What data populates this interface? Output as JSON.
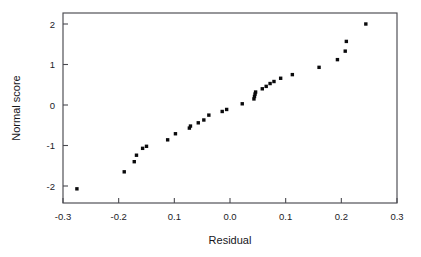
{
  "chart_data": {
    "type": "scatter",
    "title": "",
    "xlabel": "Residual",
    "ylabel": "Normal score",
    "xlim": [
      -0.3,
      0.3
    ],
    "ylim": [
      -2.2,
      2.2
    ],
    "grid": false,
    "legend": null,
    "xticks": [
      -0.3,
      -0.2,
      -0.1,
      0.0,
      0.1,
      0.2,
      0.3
    ],
    "xtick_labels": [
      "-0.3",
      "-0.2",
      "0.1",
      "0.0",
      "0.1",
      "0.2",
      "0.3"
    ],
    "yticks": [
      2,
      1,
      0,
      -1,
      -2
    ],
    "ytick_labels": [
      "2",
      "1",
      "0",
      "-1",
      "-2"
    ],
    "marker": "square",
    "marker_color": "#0a0a0c",
    "marker_size": 3.4,
    "points": [
      {
        "x": -0.275,
        "y": -2.07
      },
      {
        "x": -0.19,
        "y": -1.65
      },
      {
        "x": -0.172,
        "y": -1.4
      },
      {
        "x": -0.168,
        "y": -1.24
      },
      {
        "x": -0.157,
        "y": -1.07
      },
      {
        "x": -0.15,
        "y": -1.02
      },
      {
        "x": -0.112,
        "y": -0.86
      },
      {
        "x": -0.098,
        "y": -0.71
      },
      {
        "x": -0.073,
        "y": -0.57
      },
      {
        "x": -0.071,
        "y": -0.52
      },
      {
        "x": -0.057,
        "y": -0.44
      },
      {
        "x": -0.047,
        "y": -0.37
      },
      {
        "x": -0.038,
        "y": -0.25
      },
      {
        "x": -0.014,
        "y": -0.16
      },
      {
        "x": -0.006,
        "y": -0.11
      },
      {
        "x": 0.022,
        "y": 0.03
      },
      {
        "x": 0.043,
        "y": 0.15
      },
      {
        "x": 0.044,
        "y": 0.21
      },
      {
        "x": 0.045,
        "y": 0.27
      },
      {
        "x": 0.046,
        "y": 0.32
      },
      {
        "x": 0.058,
        "y": 0.4
      },
      {
        "x": 0.065,
        "y": 0.46
      },
      {
        "x": 0.072,
        "y": 0.53
      },
      {
        "x": 0.079,
        "y": 0.58
      },
      {
        "x": 0.091,
        "y": 0.66
      },
      {
        "x": 0.112,
        "y": 0.75
      },
      {
        "x": 0.16,
        "y": 0.93
      },
      {
        "x": 0.193,
        "y": 1.12
      },
      {
        "x": 0.207,
        "y": 1.33
      },
      {
        "x": 0.209,
        "y": 1.57
      },
      {
        "x": 0.244,
        "y": 2.0
      }
    ]
  },
  "figure": {
    "background_color": "#ffffff",
    "frame_color": "#4a4a50",
    "text_color": "#16161a"
  }
}
